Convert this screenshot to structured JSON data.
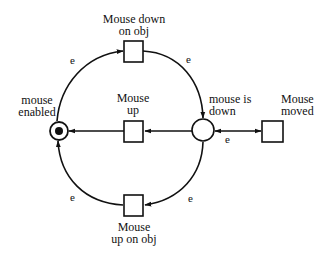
{
  "diagram": {
    "type": "petri-net",
    "colors": {
      "stroke": "#111111",
      "background": "#ffffff",
      "token": "#111111"
    },
    "places": [
      {
        "id": "mouse_enabled",
        "label": "mouse\nenabled",
        "has_token": true
      },
      {
        "id": "mouse_is_down",
        "label": "mouse is\ndown",
        "has_token": false
      }
    ],
    "transitions": [
      {
        "id": "mouse_down_on_obj",
        "label": "Mouse down\non obj"
      },
      {
        "id": "mouse_up",
        "label": "Mouse\nup"
      },
      {
        "id": "mouse_up_on_obj",
        "label": "Mouse\nup on obj"
      },
      {
        "id": "mouse_moved",
        "label": "Mouse\nmoved"
      }
    ],
    "arcs": [
      {
        "from": "mouse_enabled",
        "to": "mouse_down_on_obj",
        "label": "e"
      },
      {
        "from": "mouse_down_on_obj",
        "to": "mouse_is_down",
        "label": "e"
      },
      {
        "from": "mouse_is_down",
        "to": "mouse_up",
        "label": ""
      },
      {
        "from": "mouse_up",
        "to": "mouse_enabled",
        "label": ""
      },
      {
        "from": "mouse_is_down",
        "to": "mouse_moved",
        "label": "e",
        "bidirectional": true
      },
      {
        "from": "mouse_is_down",
        "to": "mouse_up_on_obj",
        "label": "e"
      },
      {
        "from": "mouse_up_on_obj",
        "to": "mouse_enabled",
        "label": "e"
      }
    ],
    "labels": {
      "mouse_enabled": "mouse\nenabled",
      "mouse_is_down": "mouse is\ndown",
      "mouse_down_on_obj": "Mouse down\non obj",
      "mouse_up": "Mouse\nup",
      "mouse_up_on_obj": "Mouse\nup on obj",
      "mouse_moved": "Mouse\nmoved",
      "edge_top_left": "e",
      "edge_top_right": "e",
      "edge_moved": "e",
      "edge_bottom_right": "e",
      "edge_bottom_left": "e"
    }
  }
}
